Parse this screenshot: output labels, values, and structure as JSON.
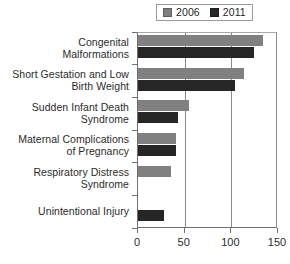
{
  "chart_data": {
    "type": "bar",
    "orientation": "horizontal",
    "title": "",
    "xlabel": "",
    "ylabel": "",
    "xlim": [
      0,
      150
    ],
    "xticks": [
      0,
      50,
      100,
      150
    ],
    "xtick_labels": [
      "0",
      "50",
      "100",
      "150"
    ],
    "grid": "vertical",
    "legend_position": "top-right",
    "categories": [
      "Congenital\nMalformations",
      "Short Gestation and Low\nBirth Weight",
      "Sudden Infant Death\nSyndrome",
      "Maternal Complications\nof Pregnancy",
      "Respiratory Distress\nSyndrome",
      "Unintentional Injury"
    ],
    "series": [
      {
        "name": "2006",
        "color": "#808080",
        "values": [
          136,
          114,
          55,
          41,
          36,
          null
        ]
      },
      {
        "name": "2011",
        "color": "#262626",
        "values": [
          126,
          104,
          44,
          41,
          null,
          28
        ]
      }
    ]
  },
  "legend": {
    "items": [
      {
        "label": "2006",
        "color": "#808080",
        "swatch": "legend-swatch-2006"
      },
      {
        "label": "2011",
        "color": "#262626",
        "swatch": "legend-swatch-2011"
      }
    ]
  },
  "categories": {
    "c0_line1": "Congenital",
    "c0_line2": "Malformations",
    "c1_line1": "Short Gestation and Low",
    "c1_line2": "Birth Weight",
    "c2_line1": "Sudden Infant Death",
    "c2_line2": "Syndrome",
    "c3_line1": "Maternal Complications",
    "c3_line2": "of Pregnancy",
    "c4_line1": "Respiratory Distress",
    "c4_line2": "Syndrome",
    "c5_line1": "Unintentional Injury"
  },
  "axis": {
    "t0": "0",
    "t1": "50",
    "t2": "100",
    "t3": "150"
  },
  "colors": {
    "series_2006": "#808080",
    "series_2011": "#262626",
    "axis": "#6f6f6f",
    "grid": "#8a8a8a",
    "text": "#2b2b2b",
    "background": "#ffffff"
  }
}
